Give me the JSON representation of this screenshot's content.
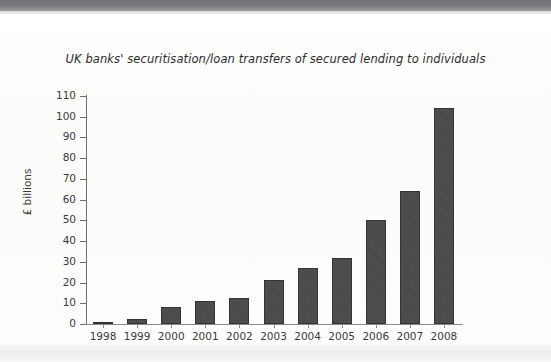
{
  "page": {
    "background_color": "#ffffff",
    "top_band_color": "#76787c"
  },
  "chart_data": {
    "type": "bar",
    "title": "UK banks' securitisation/loan transfers of secured lending to individuals",
    "xlabel": "",
    "ylabel": "£ billions",
    "categories": [
      "1998",
      "1999",
      "2000",
      "2001",
      "2002",
      "2003",
      "2004",
      "2005",
      "2006",
      "2007",
      "2008"
    ],
    "values": [
      0.3,
      2.5,
      8,
      11,
      12.5,
      21,
      27,
      32,
      50,
      64,
      104
    ],
    "ylim": [
      0,
      110
    ],
    "ytick_values": [
      0,
      10,
      20,
      30,
      40,
      50,
      60,
      70,
      80,
      90,
      100,
      110
    ],
    "ytick_labels": [
      "0",
      "10",
      "20",
      "30",
      "40",
      "50",
      "60",
      "70",
      "80",
      "90",
      "100",
      "110"
    ],
    "grid": false,
    "legend": null,
    "bar_color": "#4a4a4a",
    "bar_edge_color": "#343434",
    "axis_color": "#6e6e6e",
    "text_color": "#3a3a3a"
  }
}
